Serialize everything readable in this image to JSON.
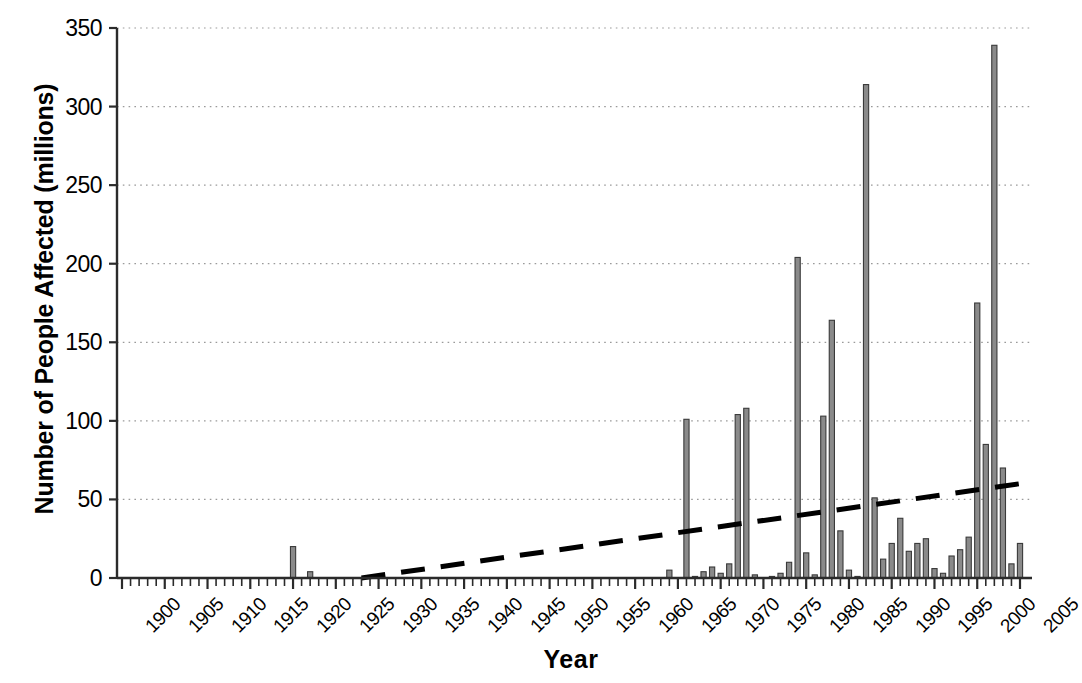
{
  "chart_data": {
    "type": "bar",
    "title": "",
    "subtitle": "",
    "xlabel": "Year",
    "ylabel": "Number of People Affected (millions)",
    "xlim": [
      1900,
      2005
    ],
    "ylim": [
      0,
      350
    ],
    "yticks": [
      0,
      50,
      100,
      150,
      200,
      250,
      300,
      350
    ],
    "ytick_labels": [
      "0",
      "50",
      "100",
      "150",
      "200",
      "250",
      "300",
      "350"
    ],
    "xticks": [
      1900,
      1905,
      1910,
      1915,
      1920,
      1925,
      1930,
      1935,
      1940,
      1945,
      1950,
      1955,
      1960,
      1965,
      1970,
      1975,
      1980,
      1985,
      1990,
      1995,
      2000,
      2005
    ],
    "xtick_labels": [
      "1900",
      "1905",
      "1910",
      "1915",
      "1920",
      "1925",
      "1930",
      "1935",
      "1940",
      "1945",
      "1950",
      "1955",
      "1960",
      "1965",
      "1970",
      "1975",
      "1980",
      "1985",
      "1990",
      "1995",
      "2000",
      "2005"
    ],
    "xtick_minor_step": 1,
    "grid": "horizontal-dotted",
    "legend": "none",
    "bar_color": "#8a8a8a",
    "bar_edge_color": "#3a3a3a",
    "trend_color": "#000000",
    "trend_style": "dashed",
    "categories": [
      1900,
      1901,
      1902,
      1903,
      1904,
      1905,
      1906,
      1907,
      1908,
      1909,
      1910,
      1911,
      1912,
      1913,
      1914,
      1915,
      1916,
      1917,
      1918,
      1919,
      1920,
      1921,
      1922,
      1923,
      1924,
      1925,
      1926,
      1927,
      1928,
      1929,
      1930,
      1931,
      1932,
      1933,
      1934,
      1935,
      1936,
      1937,
      1938,
      1939,
      1940,
      1941,
      1942,
      1943,
      1944,
      1945,
      1946,
      1947,
      1948,
      1949,
      1950,
      1951,
      1952,
      1953,
      1954,
      1955,
      1956,
      1957,
      1958,
      1959,
      1960,
      1961,
      1962,
      1963,
      1964,
      1965,
      1966,
      1967,
      1968,
      1969,
      1970,
      1971,
      1972,
      1973,
      1974,
      1975,
      1976,
      1977,
      1978,
      1979,
      1980,
      1981,
      1982,
      1983,
      1984,
      1985,
      1986,
      1987,
      1988,
      1989,
      1990,
      1991,
      1992,
      1993,
      1994,
      1995,
      1996,
      1997,
      1998,
      1999,
      2000,
      2001,
      2002,
      2003,
      2004,
      2005
    ],
    "values": [
      0,
      0,
      0,
      0,
      0,
      0,
      0,
      0,
      0,
      0,
      0,
      0,
      0,
      0,
      0,
      0,
      0,
      0,
      0,
      0,
      20,
      0,
      4,
      0,
      0,
      0,
      0,
      0,
      0,
      0,
      0,
      0,
      0,
      0,
      0,
      0,
      0,
      0,
      0,
      0,
      0,
      0,
      0,
      0,
      0,
      0,
      0,
      0,
      0,
      0,
      0,
      0,
      0,
      0,
      0,
      0,
      0,
      0,
      0,
      0,
      0,
      0,
      0,
      0,
      5,
      0,
      101,
      1,
      4,
      7,
      3,
      9,
      104,
      108,
      2,
      0,
      1,
      3,
      10,
      204,
      16,
      2,
      103,
      164,
      30,
      5,
      1,
      314,
      51,
      12,
      22,
      38,
      17,
      22,
      25,
      6,
      3,
      14,
      18,
      26,
      175,
      85,
      339,
      70,
      9,
      22
    ],
    "trendline": {
      "label": "linear trend",
      "x_start": 1928,
      "y_start": 0,
      "x_end": 2005,
      "y_end": 60
    }
  }
}
